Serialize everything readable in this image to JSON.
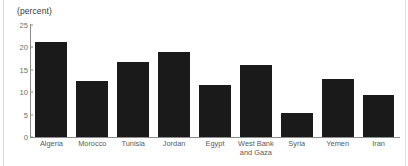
{
  "chart_data": {
    "type": "bar",
    "title": "",
    "subtitle": "",
    "xlabel": "",
    "ylabel": "(percent)",
    "ylim": [
      0,
      25
    ],
    "yticks": [
      0,
      5,
      10,
      15,
      20,
      25
    ],
    "grid": false,
    "legend": null,
    "bar_color": "#1a1a1a",
    "axis_color": "#8c8c8c",
    "tick_label_color": "#6e6e6e",
    "categories": [
      "Algeria",
      "Morocco",
      "Tunisia",
      "Jordan",
      "Egypt",
      "West Bank\nand Gaza",
      "Syria",
      "Yemen",
      "Iran"
    ],
    "values": [
      21.2,
      12.5,
      16.7,
      19.0,
      11.7,
      16.0,
      5.4,
      12.9,
      9.4
    ]
  }
}
